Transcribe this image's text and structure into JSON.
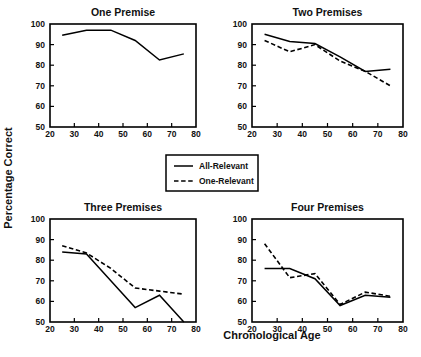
{
  "figure": {
    "xlabel": "Chronological Age",
    "ylabel": "Percentage Correct"
  },
  "legend": {
    "items": [
      {
        "label": "All-Relevant",
        "style": "solid"
      },
      {
        "label": "One-Relevant",
        "style": "dashed"
      }
    ]
  },
  "chart_data": [
    {
      "type": "line",
      "title": "One Premise",
      "xlabel": "Chronological Age",
      "ylabel": "Percentage Correct",
      "xlim": [
        20,
        80
      ],
      "ylim": [
        50,
        100
      ],
      "xticks": [
        20,
        30,
        40,
        50,
        60,
        70,
        80
      ],
      "yticks": [
        50,
        60,
        70,
        80,
        90,
        100
      ],
      "grid": false,
      "x": [
        25,
        35,
        45,
        55,
        65,
        75
      ],
      "series": [
        {
          "name": "All-Relevant",
          "style": "solid",
          "values": [
            94.5,
            97.0,
            97.0,
            92.0,
            82.5,
            85.5
          ]
        }
      ]
    },
    {
      "type": "line",
      "title": "Two Premises",
      "xlabel": "Chronological Age",
      "ylabel": "Percentage Correct",
      "xlim": [
        20,
        80
      ],
      "ylim": [
        50,
        100
      ],
      "xticks": [
        20,
        30,
        40,
        50,
        60,
        70,
        80
      ],
      "yticks": [
        50,
        60,
        70,
        80,
        90,
        100
      ],
      "grid": false,
      "x": [
        25,
        35,
        45,
        55,
        65,
        75
      ],
      "series": [
        {
          "name": "All-Relevant",
          "style": "solid",
          "values": [
            95.0,
            91.5,
            90.5,
            84.0,
            77.0,
            78.0
          ]
        },
        {
          "name": "One-Relevant",
          "style": "dashed",
          "values": [
            92.0,
            86.5,
            90.0,
            82.0,
            77.0,
            70.0
          ]
        }
      ]
    },
    {
      "type": "line",
      "title": "Three Premises",
      "xlabel": "Chronological Age",
      "ylabel": "Percentage Correct",
      "xlim": [
        20,
        80
      ],
      "ylim": [
        50,
        100
      ],
      "xticks": [
        20,
        30,
        40,
        50,
        60,
        70,
        80
      ],
      "yticks": [
        50,
        60,
        70,
        80,
        90,
        100
      ],
      "grid": false,
      "x": [
        25,
        35,
        45,
        55,
        65,
        75
      ],
      "series": [
        {
          "name": "All-Relevant",
          "style": "solid",
          "values": [
            84.0,
            83.0,
            70.0,
            57.0,
            63.0,
            50.0
          ]
        },
        {
          "name": "One-Relevant",
          "style": "dashed",
          "values": [
            87.0,
            83.5,
            76.0,
            66.5,
            65.0,
            63.5
          ]
        }
      ]
    },
    {
      "type": "line",
      "title": "Four Premises",
      "xlabel": "Chronological Age",
      "ylabel": "Percentage Correct",
      "xlim": [
        20,
        80
      ],
      "ylim": [
        50,
        100
      ],
      "xticks": [
        20,
        30,
        40,
        50,
        60,
        70,
        80
      ],
      "yticks": [
        50,
        60,
        70,
        80,
        90,
        100
      ],
      "grid": false,
      "x": [
        25,
        35,
        45,
        55,
        65,
        75
      ],
      "series": [
        {
          "name": "All-Relevant",
          "style": "solid",
          "values": [
            76.0,
            76.0,
            71.0,
            58.0,
            63.0,
            62.0
          ]
        },
        {
          "name": "One-Relevant",
          "style": "dashed",
          "values": [
            88.0,
            71.5,
            73.5,
            58.5,
            64.5,
            62.5
          ]
        }
      ]
    }
  ]
}
